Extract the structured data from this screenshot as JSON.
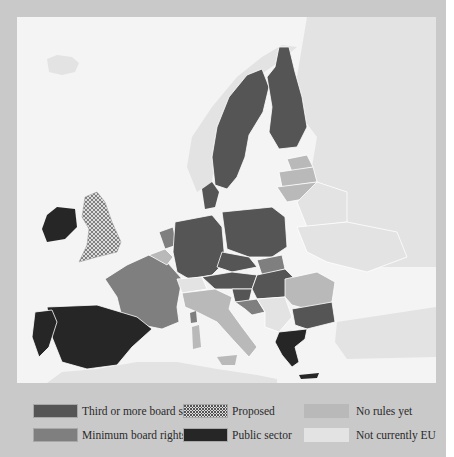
{
  "map": {
    "region": "Europe",
    "categories": [
      {
        "id": "third",
        "label": "Third or more board seats",
        "color": "#555555",
        "pattern": "solid"
      },
      {
        "id": "proposed",
        "label": "Proposed",
        "color": "#d8d8d8",
        "pattern": "dotted"
      },
      {
        "id": "norules",
        "label": "No rules yet",
        "color": "#b9b9b9",
        "pattern": "solid"
      },
      {
        "id": "minimum",
        "label": "Minimum board rights",
        "color": "#7f7f7f",
        "pattern": "solid"
      },
      {
        "id": "public",
        "label": "Public sector",
        "color": "#262626",
        "pattern": "solid"
      },
      {
        "id": "noteu",
        "label": "Not currently EU",
        "color": "#e3e3e3",
        "pattern": "solid"
      }
    ],
    "countries": {
      "Sweden": "third",
      "Finland": "third",
      "Denmark": "third",
      "Germany": "third",
      "Poland": "third",
      "Czech Republic": "third",
      "Austria": "third",
      "Hungary": "third",
      "Slovenia": "third",
      "Bulgaria": "third",
      "Luxembourg": "third",
      "France": "minimum",
      "Netherlands": "minimum",
      "Slovakia": "minimum",
      "Croatia": "minimum",
      "United Kingdom": "proposed",
      "Ireland": "public",
      "Spain": "public",
      "Portugal": "public",
      "Greece": "public",
      "Italy": "norules",
      "Belgium": "norules",
      "Estonia": "norules",
      "Latvia": "norules",
      "Lithuania": "norules",
      "Romania": "norules",
      "Cyprus": "norules",
      "Norway": "noteu",
      "Switzerland": "noteu",
      "Iceland": "noteu",
      "Russia": "noteu",
      "Belarus": "noteu",
      "Ukraine": "noteu",
      "Turkey": "noteu",
      "Serbia": "noteu"
    }
  },
  "legend": {
    "items": [
      {
        "label": "Third or more board seats"
      },
      {
        "label": "Proposed"
      },
      {
        "label": "No rules yet"
      },
      {
        "label": "Minimum board rights"
      },
      {
        "label": "Public sector"
      },
      {
        "label": "Not currently EU"
      }
    ]
  }
}
